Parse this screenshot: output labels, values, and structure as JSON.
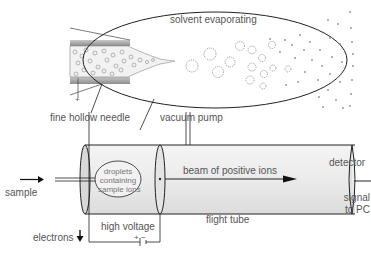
{
  "diagram": {
    "labels": {
      "solvent_evaporating": "solvent evaporating",
      "fine_hollow_needle": "fine hollow needle",
      "vacuum_pump": "vacuum pump",
      "sample": "sample",
      "droplets_line1": "droplets",
      "droplets_line2": "containing",
      "droplets_line3": "sample ions",
      "beam": "beam of positive ions",
      "detector": "detector",
      "signal_line1": "signal",
      "signal_line2": "to PC",
      "flight_tube": "flight tube",
      "electrons": "electrons",
      "high_voltage": "high voltage",
      "polarity": "+  −",
      "needle_plus": "+"
    },
    "colors": {
      "line": "#1a1a1a",
      "tube_fill": "#ececec",
      "needle_wall": "#9a9a9a",
      "droplet": "#8a8a8a",
      "text": "#555555"
    }
  }
}
